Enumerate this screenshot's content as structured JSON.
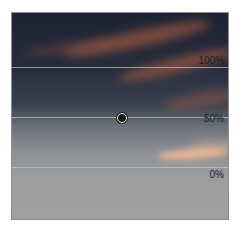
{
  "levels_panel": {
    "labels": {
      "top": "100%",
      "middle": "50%",
      "bottom": "0%"
    },
    "marker": {
      "x_percent": 50,
      "y_percent": 50
    },
    "line_color": "#c8c8c8"
  }
}
